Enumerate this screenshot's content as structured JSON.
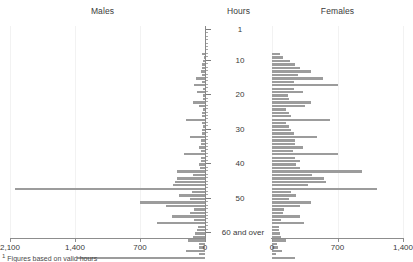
{
  "chart_data": {
    "type": "bar",
    "title": "",
    "subtitle": "",
    "orientation": "horizontal",
    "layout": "back-to-back population pyramid",
    "panels": [
      {
        "name": "males",
        "label": "Males",
        "direction": "left",
        "xlabel": "",
        "xlim": [
          2100,
          0
        ],
        "xticks": [
          2100,
          1400,
          700,
          0
        ],
        "xtick_labels": [
          "2,100",
          "1,400",
          "700",
          "0"
        ]
      },
      {
        "name": "females",
        "label": "Females",
        "direction": "right",
        "xlabel": "",
        "xlim": [
          0,
          1400
        ],
        "xticks": [
          0,
          700,
          1400
        ],
        "xtick_labels": [
          "0",
          "700",
          "1,400"
        ]
      }
    ],
    "ylabel": "Hours",
    "ycategories": [
      "1",
      "2",
      "3",
      "4",
      "5",
      "6",
      "7",
      "8",
      "9",
      "10",
      "11",
      "12",
      "13",
      "14",
      "15",
      "16",
      "17",
      "18",
      "19",
      "20",
      "21",
      "22",
      "23",
      "24",
      "25",
      "26",
      "27",
      "28",
      "29",
      "30",
      "31",
      "32",
      "33",
      "34",
      "35",
      "36",
      "37",
      "38",
      "39",
      "40",
      "41",
      "42",
      "43",
      "44",
      "45",
      "46",
      "47",
      "48",
      "49",
      "50",
      "51",
      "52",
      "53",
      "54",
      "55",
      "56",
      "57",
      "58",
      "59",
      "60 and over"
    ],
    "ytick_labels": [
      "1",
      "10",
      "20",
      "30",
      "40",
      "50",
      "60 and over"
    ],
    "ytick_positions": [
      1,
      10,
      20,
      30,
      40,
      50,
      60
    ],
    "grid": true,
    "legend": "none",
    "series": [
      {
        "name": "Males",
        "panel": "males",
        "color": "#9c9c9c",
        "values": [
          30,
          14,
          18,
          28,
          30,
          40,
          30,
          100,
          28,
          120,
          20,
          90,
          18,
          26,
          130,
          60,
          22,
          28,
          34,
          200,
          28,
          26,
          34,
          34,
          160,
          44,
          40,
          60,
          42,
          230,
          40,
          46,
          60,
          52,
          300,
          130,
          300,
          320,
          350,
          2050,
          140,
          280,
          160,
          700,
          420,
          120,
          160,
          360,
          120,
          520,
          80,
          90,
          110,
          130,
          180,
          60,
          70,
          200,
          60,
          1380
        ]
      },
      {
        "name": "Females",
        "panel": "females",
        "color": "#9c9c9c",
        "values": [
          90,
          120,
          190,
          250,
          300,
          420,
          280,
          540,
          240,
          700,
          230,
          330,
          170,
          180,
          420,
          350,
          150,
          180,
          200,
          620,
          150,
          180,
          200,
          230,
          480,
          250,
          250,
          330,
          220,
          700,
          250,
          300,
          260,
          300,
          960,
          430,
          560,
          580,
          380,
          1120,
          200,
          260,
          180,
          420,
          300,
          130,
          120,
          300,
          100,
          340,
          70,
          80,
          90,
          100,
          150,
          50,
          60,
          110,
          40,
          250
        ]
      }
    ]
  },
  "footnote": {
    "marker": "1",
    "text": "Figures based on valid hours"
  }
}
